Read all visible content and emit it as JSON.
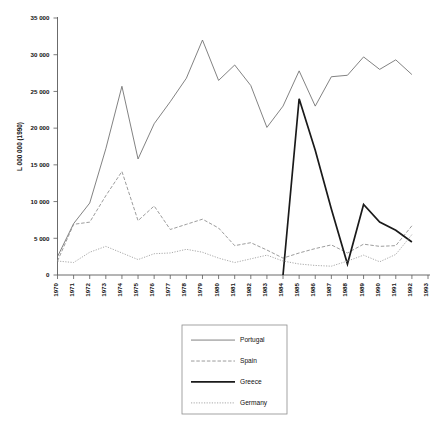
{
  "chart_data": {
    "type": "line",
    "title": "",
    "xlabel": "",
    "ylabel": "L 000 000 (1990)",
    "x": [
      1970,
      1971,
      1972,
      1973,
      1974,
      1975,
      1976,
      1977,
      1978,
      1979,
      1980,
      1981,
      1982,
      1983,
      1984,
      1985,
      1986,
      1987,
      1988,
      1989,
      1990,
      1991,
      1992,
      1993
    ],
    "xtick_labels": [
      "1970",
      "1971",
      "1972",
      "1973",
      "1974",
      "1975",
      "1976",
      "1977",
      "1978",
      "1979",
      "1980",
      "1981",
      "1982",
      "1983",
      "1984",
      "1985",
      "1986",
      "1987",
      "1988",
      "1989",
      "1990",
      "1991",
      "1992",
      "1993"
    ],
    "ytick_labels": [
      "0",
      "5 000",
      "10 000",
      "15 000",
      "20 000",
      "25 000",
      "30 000",
      "35 000"
    ],
    "ytick_values": [
      0,
      5000,
      10000,
      15000,
      20000,
      25000,
      30000,
      35000
    ],
    "ylim": [
      0,
      35000
    ],
    "xlim": [
      1970,
      1993
    ],
    "grid": false,
    "legend_position": "below-center",
    "series": [
      {
        "name": "Portugal",
        "style": "solid-thin",
        "color": "#6b6b6b",
        "x": [
          1970,
          1971,
          1972,
          1973,
          1974,
          1975,
          1976,
          1977,
          1978,
          1979,
          1980,
          1981,
          1982,
          1983,
          1984,
          1985,
          1986,
          1987,
          1988,
          1989,
          1990,
          1991,
          1992
        ],
        "values": [
          2500,
          7000,
          9800,
          17200,
          25700,
          15800,
          20600,
          23600,
          26800,
          32000,
          26500,
          28600,
          25800,
          20100,
          23000,
          27800,
          23000,
          27000,
          27200,
          29700,
          28000,
          29300,
          27300
        ]
      },
      {
        "name": "Spain",
        "style": "dashed",
        "color": "#8a8a8a",
        "x": [
          1970,
          1971,
          1972,
          1973,
          1974,
          1975,
          1976,
          1977,
          1978,
          1979,
          1980,
          1981,
          1982,
          1983,
          1984,
          1985,
          1986,
          1987,
          1988,
          1989,
          1990,
          1991,
          1992
        ],
        "values": [
          1900,
          6900,
          7200,
          10800,
          14100,
          7400,
          9400,
          6200,
          6900,
          7600,
          6400,
          4000,
          4400,
          3400,
          2300,
          3000,
          3600,
          4100,
          3000,
          4200,
          3900,
          4000,
          6700
        ]
      },
      {
        "name": "Greece",
        "style": "solid-thick",
        "color": "#1a1a1a",
        "x": [
          1984,
          1985,
          1986,
          1987,
          1988,
          1989,
          1990,
          1991,
          1992
        ],
        "values": [
          0,
          24000,
          17000,
          9000,
          1500,
          9600,
          7200,
          6100,
          4500
        ]
      },
      {
        "name": "Germany",
        "style": "dotted",
        "color": "#9a9a9a",
        "x": [
          1970,
          1971,
          1972,
          1973,
          1974,
          1975,
          1976,
          1977,
          1978,
          1979,
          1980,
          1981,
          1982,
          1983,
          1984,
          1985,
          1986,
          1987,
          1988,
          1989,
          1990,
          1991,
          1992
        ],
        "values": [
          1900,
          1700,
          3100,
          3900,
          3000,
          2100,
          2900,
          3000,
          3500,
          3100,
          2300,
          1700,
          2200,
          2700,
          1900,
          1500,
          1300,
          1200,
          1900,
          2700,
          1800,
          2800,
          5500
        ]
      }
    ]
  },
  "legend": {
    "items": [
      {
        "label": "Portugal"
      },
      {
        "label": "Spain"
      },
      {
        "label": "Greece"
      },
      {
        "label": "Germany"
      }
    ]
  }
}
